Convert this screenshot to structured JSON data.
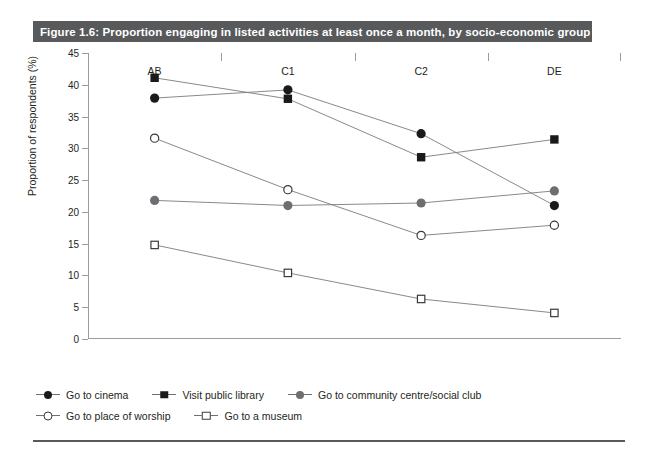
{
  "figure": {
    "title": "Figure 1.6: Proportion engaging in listed activities at least once a month, by socio-economic group",
    "title_bar_color": "#58595b",
    "footer_rule_color": "#58595b"
  },
  "chart_data": {
    "type": "line",
    "title": "Figure 1.6: Proportion engaging in listed activities at least once a month, by socio-economic group",
    "xlabel": "",
    "ylabel": "Proportion of respondents (%)",
    "categories": [
      "AB",
      "C1",
      "C2",
      "DE"
    ],
    "ylim": [
      0,
      45
    ],
    "yticks": [
      0,
      5,
      10,
      15,
      20,
      25,
      30,
      35,
      40,
      45
    ],
    "ytick_labels": [
      "0",
      "5",
      "10",
      "15",
      "20",
      "25",
      "30",
      "35",
      "40",
      "45"
    ],
    "grid": false,
    "legend_position": "bottom-left",
    "series": [
      {
        "name": "Go to cinema",
        "marker": "circle-filled",
        "color": "#1a1a1a",
        "values": [
          37.9,
          39.2,
          32.3,
          21.0
        ]
      },
      {
        "name": "Visit public library",
        "marker": "square-filled",
        "color": "#1a1a1a",
        "values": [
          41.1,
          37.8,
          28.6,
          31.4
        ]
      },
      {
        "name": "Go to community centre/social club",
        "marker": "circle-gray",
        "color": "#6d6e71",
        "values": [
          21.8,
          21.0,
          21.4,
          23.3
        ]
      },
      {
        "name": "Go to place of worship",
        "marker": "circle-open",
        "color": "#3a3a3a",
        "values": [
          31.6,
          23.5,
          16.3,
          17.9
        ]
      },
      {
        "name": "Go to a museum",
        "marker": "square-open",
        "color": "#3a3a3a",
        "values": [
          14.8,
          10.4,
          6.3,
          4.1
        ]
      }
    ]
  },
  "legend": {
    "rows": [
      [
        {
          "label": "Go to cinema",
          "marker": "circle-filled"
        },
        {
          "label": "Visit public library",
          "marker": "square-filled"
        },
        {
          "label": "Go to community centre/social club",
          "marker": "circle-gray"
        }
      ],
      [
        {
          "label": "Go to place of worship",
          "marker": "circle-open"
        },
        {
          "label": "Go to a museum",
          "marker": "square-open"
        }
      ]
    ]
  }
}
